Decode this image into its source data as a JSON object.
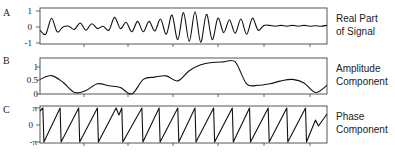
{
  "chart_data": [
    {
      "type": "line",
      "panel": "A",
      "title": "Real Part of Signal",
      "side_label_lines": [
        "Real Part",
        "of Signal"
      ],
      "ylabel": "",
      "xlabel": "",
      "yticks": [
        "1",
        "0",
        "-1"
      ],
      "ylim": [
        -1,
        1
      ],
      "x": [
        0,
        2,
        4,
        6,
        8,
        10,
        12,
        14,
        16,
        18,
        20,
        22,
        24,
        26,
        28,
        30,
        32,
        34,
        36,
        38,
        40,
        42,
        44,
        46,
        48,
        50,
        52,
        54,
        56,
        58,
        60,
        62,
        64,
        66,
        68,
        70,
        72,
        74,
        76,
        78,
        80,
        82,
        84,
        86,
        88,
        90,
        92,
        94,
        96,
        98,
        100
      ],
      "values": [
        -0.2,
        -0.45,
        0.55,
        -0.3,
        0.0,
        0.05,
        -0.15,
        0.25,
        -0.2,
        0.2,
        -0.1,
        0.05,
        -0.2,
        0.6,
        -0.1,
        0.3,
        -0.3,
        0.35,
        -0.3,
        0.35,
        -0.25,
        0.5,
        -0.45,
        0.75,
        -0.8,
        0.9,
        -0.9,
        0.95,
        -0.95,
        0.8,
        -0.8,
        0.55,
        -0.35,
        0.45,
        -0.4,
        0.5,
        -0.45,
        0.55,
        -0.2,
        0.1,
        0.1,
        0.05,
        0.1,
        0.05,
        0.1,
        0.05,
        0.1,
        0.05,
        0.08,
        0.05,
        0.1
      ]
    },
    {
      "type": "line",
      "panel": "B",
      "title": "Amplitude Component",
      "side_label_lines": [
        "Amplitude",
        "Component"
      ],
      "yticks": [
        "1",
        "0.5",
        "0"
      ],
      "ylim": [
        0,
        1.2
      ],
      "x": [
        0,
        4,
        8,
        12,
        16,
        20,
        24,
        28,
        32,
        36,
        40,
        44,
        48,
        52,
        56,
        60,
        64,
        68,
        72,
        76,
        80,
        84,
        88,
        92,
        96,
        100
      ],
      "values": [
        0.5,
        0.63,
        0.4,
        0.05,
        0.12,
        0.35,
        0.28,
        0.22,
        0.0,
        0.5,
        0.58,
        0.62,
        0.45,
        0.8,
        1.0,
        1.08,
        1.1,
        1.1,
        0.35,
        0.3,
        0.35,
        0.45,
        0.5,
        0.38,
        0.05,
        0.3
      ]
    },
    {
      "type": "line",
      "panel": "C",
      "title": "Phase Component",
      "side_label_lines": [
        "Phase",
        "Component"
      ],
      "yticks": [
        "π",
        "0",
        "-π"
      ],
      "ylim": [
        -3.1416,
        3.1416
      ],
      "description": "Sawtooth phase wrapping between -π and π, roughly 15 cycles, with a double-peak near x≈27% and a final partial ramp",
      "wrap_peaks_x_percent": [
        1,
        7,
        13.5,
        20,
        26.5,
        28.5,
        35.5,
        41.5,
        48,
        54,
        60.5,
        67,
        73,
        79.5,
        86,
        92.5
      ]
    }
  ],
  "panels": [
    {
      "letter": "A",
      "ticks": [
        "1",
        "0",
        "-1"
      ],
      "label1": "Real Part",
      "label2": "of Signal"
    },
    {
      "letter": "B",
      "ticks": [
        "1",
        "0.5",
        "0"
      ],
      "label1": "Amplitude",
      "label2": "Component"
    },
    {
      "letter": "C",
      "ticks": [
        "π",
        "0",
        "-π"
      ],
      "label1": "Phase",
      "label2": "Component"
    }
  ]
}
